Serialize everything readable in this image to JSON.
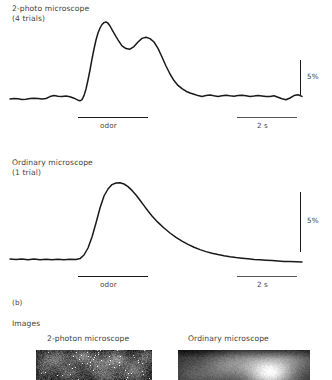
{
  "figure": {
    "panel_b_tag": "(b)",
    "images_heading": "Images"
  },
  "panels": [
    {
      "id": "two-photon-trace",
      "title_line1": "2-photo microscope",
      "title_line2": "(4 trials)",
      "odor_label": "odor",
      "time_label": "2 s",
      "scale_label": "5%"
    },
    {
      "id": "ordinary-trace",
      "title_line1": "Ordinary microscope",
      "title_line2": "(1 trial)",
      "odor_label": "odor",
      "time_label": "2 s",
      "scale_label": "5%"
    }
  ],
  "images": [
    {
      "id": "two-photon-image",
      "caption": "2-photon microscope"
    },
    {
      "id": "ordinary-image",
      "caption": "Ordinary microscope"
    }
  ],
  "chart_data": [
    {
      "type": "line",
      "title": "2-photo microscope (4 trials)",
      "xlabel": "",
      "ylabel": "dF/F (%)",
      "series": [
        {
          "name": "2-photon microscope (4 trials)",
          "x": [
            10,
            14,
            18,
            22,
            26,
            30,
            34,
            38,
            42,
            46,
            50,
            54,
            58,
            62,
            66,
            70,
            74,
            78,
            80,
            82,
            84,
            86,
            88,
            90,
            92,
            94,
            96,
            98,
            100,
            102,
            104,
            106,
            108,
            110,
            112,
            114,
            116,
            118,
            120,
            122,
            126,
            130,
            134,
            138,
            142,
            146,
            150,
            154,
            158,
            162,
            166,
            170,
            174,
            178,
            182,
            186,
            190,
            194,
            198,
            202,
            206,
            210,
            214,
            218,
            222,
            226,
            230,
            234,
            238,
            242,
            246,
            250,
            254,
            258,
            262,
            266,
            270,
            274,
            278,
            282,
            286,
            290,
            294,
            298,
            302
          ],
          "y": [
            99,
            98.4,
            98.8,
            99.4,
            99.2,
            98.6,
            98.2,
            98.6,
            99,
            98.5,
            96.6,
            95.6,
            96.2,
            96.6,
            96.0,
            96.8,
            98.2,
            100.2,
            100.8,
            99.6,
            95.6,
            89.0,
            80.0,
            70.0,
            59.0,
            49.0,
            40.0,
            33.0,
            28.0,
            24.5,
            22.6,
            22.0,
            23.2,
            26.0,
            29.6,
            33.2,
            36.6,
            39.8,
            42.8,
            45.8,
            48.6,
            49.2,
            46.6,
            42.0,
            38.4,
            37.2,
            38.6,
            42.0,
            48.4,
            57.0,
            66.0,
            74.0,
            80.6,
            85.4,
            88.6,
            91.2,
            93.0,
            94.2,
            95.6,
            96.4,
            95.6,
            95.0,
            95.8,
            96.4,
            95.8,
            95.2,
            95.8,
            96.2,
            95.6,
            95.2,
            95.8,
            96.4,
            96.0,
            95.4,
            96.0,
            96.6,
            96.4,
            95.8,
            97.2,
            98.8,
            99.8,
            98.0,
            95.6,
            94.8,
            96.4
          ]
        }
      ],
      "annotations": [
        {
          "label": "odor",
          "type": "horizontal-bar",
          "x_start": 78,
          "x_end": 148
        },
        {
          "label": "2 s",
          "type": "scale-bar-x",
          "x_start": 237,
          "x_end": 297
        },
        {
          "label": "5%",
          "type": "scale-bar-y",
          "y_start": 60,
          "y_end": 95
        }
      ],
      "grid": false,
      "legend": "none"
    },
    {
      "type": "line",
      "title": "Ordinary microscope (1 trial)",
      "xlabel": "",
      "ylabel": "dF/F (%)",
      "series": [
        {
          "name": "Ordinary microscope (1 trial)",
          "x": [
            10,
            16,
            22,
            28,
            34,
            40,
            46,
            52,
            58,
            64,
            70,
            76,
            80,
            84,
            88,
            92,
            96,
            100,
            104,
            108,
            112,
            116,
            120,
            124,
            128,
            132,
            136,
            140,
            144,
            148,
            152,
            158,
            164,
            170,
            176,
            182,
            188,
            194,
            200,
            206,
            212,
            218,
            224,
            230,
            236,
            242,
            248,
            254,
            260,
            266,
            272,
            278,
            284,
            290,
            296,
            302
          ],
          "y": [
            259,
            259.6,
            259,
            259.8,
            259,
            259.8,
            259.2,
            259.8,
            259.2,
            259.8,
            259.2,
            259.4,
            258.6,
            255.0,
            248.0,
            237.0,
            223.0,
            208.0,
            196.0,
            189.0,
            184.6,
            183.0,
            182.8,
            184.0,
            186.6,
            190.4,
            195.0,
            200.2,
            205.6,
            211.0,
            216.0,
            222.4,
            228.0,
            233.0,
            237.4,
            241.2,
            244.4,
            247.2,
            249.6,
            251.6,
            253.2,
            254.6,
            255.8,
            256.8,
            257.6,
            258.2,
            258.8,
            259.4,
            259.8,
            260.2,
            260.6,
            261.0,
            261.4,
            261.6,
            261.8,
            262.0
          ]
        }
      ],
      "annotations": [
        {
          "label": "odor",
          "type": "horizontal-bar",
          "x_start": 78,
          "x_end": 148
        },
        {
          "label": "2 s",
          "type": "scale-bar-x",
          "x_start": 237,
          "x_end": 297
        },
        {
          "label": "5%",
          "type": "scale-bar-y",
          "y_start": 192,
          "y_end": 252
        }
      ],
      "grid": false,
      "legend": "none"
    }
  ]
}
